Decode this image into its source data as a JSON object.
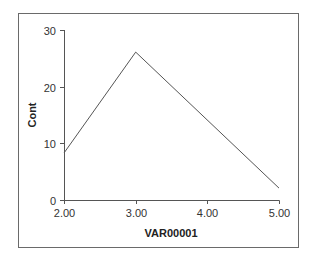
{
  "chart_data": {
    "type": "line",
    "title": "",
    "xlabel": "VAR00001",
    "ylabel": "Cont",
    "x": [
      2.0,
      3.0,
      4.0,
      5.0
    ],
    "x_tick_labels": [
      "2.00",
      "3.00",
      "4.00",
      "5.00"
    ],
    "y_ticks": [
      0,
      10,
      20,
      30
    ],
    "y_tick_labels": [
      "0",
      "10",
      "20",
      "30"
    ],
    "xlim": [
      2.0,
      5.0
    ],
    "ylim": [
      0,
      30
    ],
    "grid": false,
    "legend": null,
    "series": [
      {
        "name": "Cont",
        "x": [
          2.0,
          3.0,
          5.0
        ],
        "values": [
          8.3,
          26.1,
          2.1
        ]
      }
    ],
    "colors": {
      "line": "#555555",
      "frame": "#6a6a6a",
      "background": "#ffffff"
    }
  }
}
